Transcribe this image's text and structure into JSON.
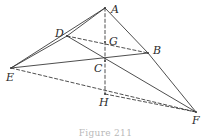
{
  "figure": {
    "caption": "Figure 211",
    "stroke_color": "#3a3a3a",
    "label_color": "#2b2b2b",
    "background": "#ffffff"
  },
  "vertices": [
    {
      "id": "A",
      "label": "A",
      "x": 105,
      "y": 8,
      "label_x": 111,
      "label_y": 4
    },
    {
      "id": "D",
      "label": "D",
      "x": 67,
      "y": 36,
      "label_x": 55,
      "label_y": 28
    },
    {
      "id": "G",
      "label": "G",
      "x": 105,
      "y": 42,
      "label_x": 109,
      "label_y": 36
    },
    {
      "id": "B",
      "label": "B",
      "x": 148,
      "y": 53,
      "label_x": 153,
      "label_y": 45
    },
    {
      "id": "C",
      "label": "C",
      "x": 105,
      "y": 61,
      "label_x": 94,
      "label_y": 63
    },
    {
      "id": "E",
      "label": "E",
      "x": 11,
      "y": 68,
      "label_x": 6,
      "label_y": 72
    },
    {
      "id": "H",
      "label": "H",
      "x": 105,
      "y": 94,
      "label_x": 99,
      "label_y": 97
    },
    {
      "id": "F",
      "label": "F",
      "x": 196,
      "y": 112,
      "label_x": 192,
      "label_y": 115
    }
  ],
  "edges": [
    {
      "id": "A-D",
      "from": "A",
      "to": "D",
      "style": "solid"
    },
    {
      "id": "A-B",
      "from": "A",
      "to": "B",
      "style": "solid"
    },
    {
      "id": "A-E",
      "from": "A",
      "to": "E",
      "style": "solid"
    },
    {
      "id": "A-H",
      "from": "A",
      "to": "H",
      "style": "dashed"
    },
    {
      "id": "D-B",
      "from": "D",
      "to": "B",
      "style": "dashed"
    },
    {
      "id": "D-E",
      "from": "D",
      "to": "E",
      "style": "solid"
    },
    {
      "id": "D-F",
      "from": "D",
      "to": "F",
      "style": "solid"
    },
    {
      "id": "E-B",
      "from": "E",
      "to": "B",
      "style": "solid"
    },
    {
      "id": "E-F",
      "from": "E",
      "to": "F",
      "style": "dashed"
    },
    {
      "id": "B-F",
      "from": "B",
      "to": "F",
      "style": "solid"
    },
    {
      "id": "H-F",
      "from": "H",
      "to": "F",
      "style": "dashed"
    }
  ]
}
